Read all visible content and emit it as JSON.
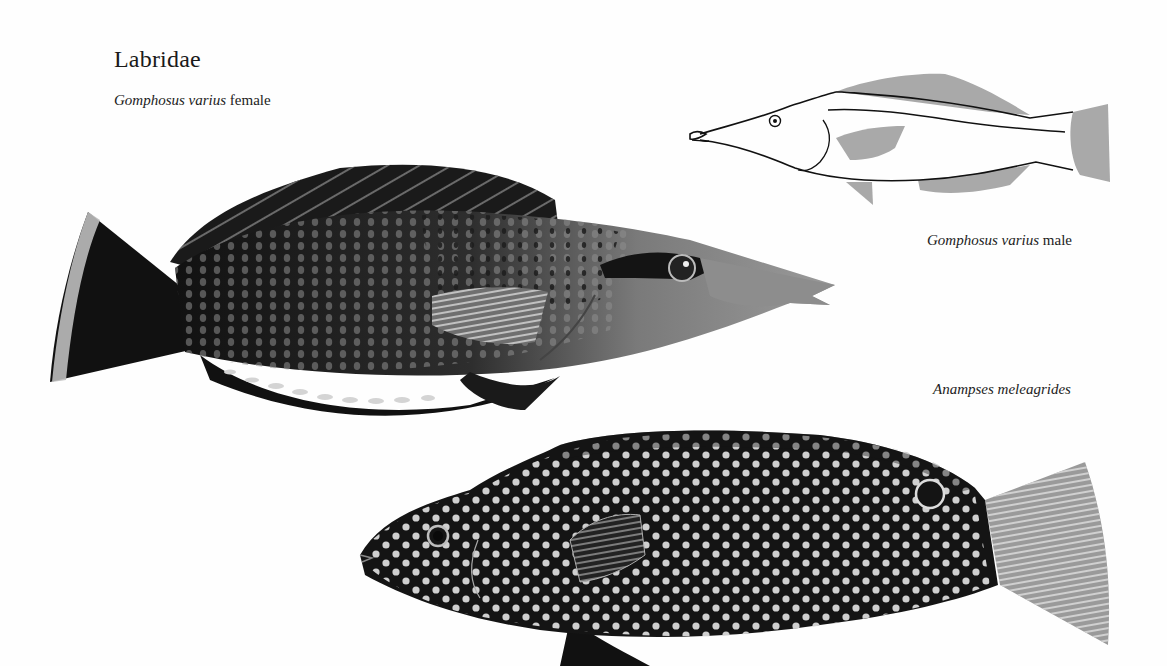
{
  "plate": {
    "family": "Labridae",
    "figures": [
      {
        "id": "female",
        "species": "Gomphosus varius",
        "qualifier": "female",
        "style": "color illustration (grayscale)"
      },
      {
        "id": "male",
        "species": "Gomphosus varius",
        "qualifier": "male",
        "style": "line drawing with gray-shaded fins"
      },
      {
        "id": "anampses",
        "species": "Anampses meleagrides",
        "qualifier": "",
        "style": "black body with white spots"
      }
    ]
  },
  "colors": {
    "background": "#fefefe",
    "dark_body": "#141414",
    "mid_gray": "#8a8a8a",
    "fin_gray": "#a6a6a6",
    "spot": "#c9c9c9"
  }
}
